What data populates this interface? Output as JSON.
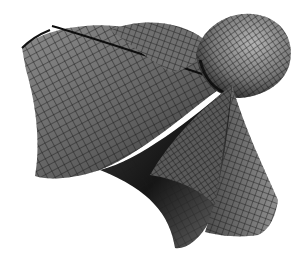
{
  "image": {
    "subject": "3D parametric surface wireframe render",
    "style": "grayscale shaded mesh",
    "background": "#ffffff",
    "colors": {
      "mesh_line": "#1a1a1a",
      "light_face": "#9a9a9a",
      "mid_face": "#6a6a6a",
      "dark_face": "#2a2a2a",
      "shadow": "#0d0d0d"
    }
  }
}
